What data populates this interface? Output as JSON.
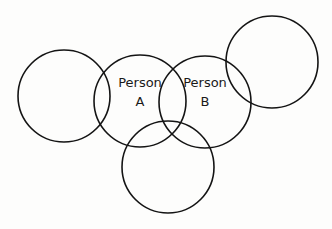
{
  "diagram": {
    "circles": [
      {
        "id": "left",
        "label_lines": []
      },
      {
        "id": "person-a",
        "label_lines": [
          "Person",
          "A"
        ]
      },
      {
        "id": "person-b",
        "label_lines": [
          "Person",
          "B"
        ]
      },
      {
        "id": "top-right",
        "label_lines": []
      },
      {
        "id": "bottom",
        "label_lines": []
      }
    ],
    "person_a": {
      "line1": "Person",
      "line2": "A"
    },
    "person_b": {
      "line1": "Person",
      "line2": "B"
    }
  }
}
